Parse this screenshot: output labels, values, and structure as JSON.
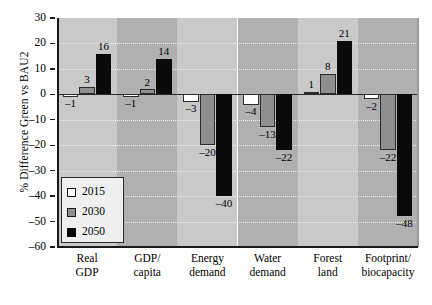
{
  "chart_data": {
    "type": "bar",
    "title": "",
    "xlabel": "",
    "ylabel": "% Difference Green vs BAU2",
    "ylim": [
      -60,
      30
    ],
    "ytick_values": [
      30,
      20,
      10,
      0,
      -10,
      -20,
      -30,
      -40,
      -50,
      -60
    ],
    "ytick_labels": [
      "30",
      "20",
      "10",
      "0",
      "–10",
      "–20",
      "–30",
      "–40",
      "–50",
      "–60"
    ],
    "grid": true,
    "legend_position": "lower-left-inside",
    "categories": [
      "Real GDP",
      "GDP/ capita",
      "Energy demand",
      "Water demand",
      "Forest land",
      "Footprint/ biocapacity"
    ],
    "category_lines": [
      [
        "Real",
        "GDP"
      ],
      [
        "GDP/",
        "capita"
      ],
      [
        "Energy",
        "demand"
      ],
      [
        "Water",
        "demand"
      ],
      [
        "Forest",
        "land"
      ],
      [
        "Footprint/",
        "biocapacity"
      ]
    ],
    "series": [
      {
        "name": "2015",
        "color": "#ffffff",
        "values": [
          -1,
          -1,
          -3,
          -4,
          1,
          -2
        ],
        "labels": [
          "–1",
          "–1",
          "–3",
          "–4",
          "1",
          "–2"
        ]
      },
      {
        "name": "2030",
        "color": "#8f8f8f",
        "values": [
          3,
          2,
          -20,
          -13,
          8,
          -22
        ],
        "labels": [
          "3",
          "2",
          "–20",
          "–13",
          "8",
          "–22"
        ]
      },
      {
        "name": "2050",
        "color": "#0a0a0a",
        "values": [
          16,
          14,
          -40,
          -22,
          21,
          -48
        ],
        "labels": [
          "16",
          "14",
          "–40",
          "–22",
          "21",
          "–48"
        ]
      }
    ]
  },
  "legend": {
    "items": [
      {
        "label": "2015",
        "swatch": "white-square"
      },
      {
        "label": "2030",
        "swatch": "gray-square"
      },
      {
        "label": "2050",
        "swatch": "black-square"
      }
    ]
  },
  "colors": {
    "band_light": "#c9c9c9",
    "band_dark": "#b0b0b0",
    "axis": "#1a1a1a",
    "grid": "#f0f0f0",
    "bar_2015": "#ffffff",
    "bar_2030": "#8f8f8f",
    "bar_2050": "#0a0a0a"
  }
}
